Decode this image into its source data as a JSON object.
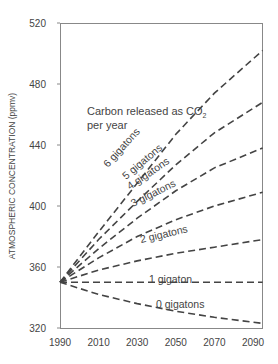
{
  "chart_data": {
    "type": "line",
    "title": "",
    "xlabel": "",
    "ylabel": "ATMOSPHERIC CONCENTRATION (ppmv)",
    "xlim": [
      1990,
      2095
    ],
    "ylim": [
      320,
      520
    ],
    "x_ticks": [
      1990,
      2010,
      2030,
      2050,
      2070,
      2090
    ],
    "y_ticks": [
      320,
      360,
      400,
      440,
      480,
      520
    ],
    "grid": false,
    "legend": "none (inline labels)",
    "annotation": {
      "line1": "Carbon released as CO",
      "subscript": "2",
      "line2": "per year"
    },
    "x": [
      1990,
      2010,
      2030,
      2050,
      2070,
      2095
    ],
    "series": [
      {
        "name": "6 gigatons",
        "values": [
          350,
          383,
          415,
          447,
          474,
          502
        ]
      },
      {
        "name": "5 gigatons",
        "values": [
          350,
          378,
          403,
          427,
          448,
          468
        ]
      },
      {
        "name": "4 gigatons",
        "values": [
          350,
          372,
          392,
          410,
          425,
          438
        ]
      },
      {
        "name": "3 gigatons",
        "values": [
          350,
          366,
          380,
          391,
          400,
          409
        ]
      },
      {
        "name": "2 gigatons",
        "values": [
          350,
          358,
          364,
          369,
          373,
          378
        ]
      },
      {
        "name": "1 gigaton",
        "values": [
          350,
          350,
          350,
          350,
          350,
          350
        ]
      },
      {
        "name": "0 gigatons",
        "values": [
          350,
          342,
          336,
          331,
          327,
          323
        ]
      }
    ]
  }
}
